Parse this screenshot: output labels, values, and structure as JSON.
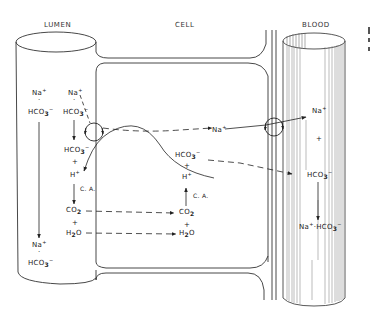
{
  "headers": {
    "lumen": "LUMEN",
    "cell": "CELL",
    "blood": "BLOOD"
  },
  "lumen_labels": {
    "left_na": {
      "base": "Na",
      "sup": "+"
    },
    "left_dot": "·",
    "left_hco3": {
      "base": "HCO",
      "sub": "3",
      "sup": "−"
    },
    "right_na": {
      "base": "Na",
      "sup": "+"
    },
    "right_dot": "·",
    "right_hco3": {
      "base": "HCO",
      "sub": "3",
      "sup": "−"
    },
    "bottom_na": {
      "base": "Na",
      "sup": "+"
    },
    "bottom_dot": "·",
    "bottom_hco3": {
      "base": "HCO",
      "sub": "3",
      "sup": "−"
    }
  },
  "luminal_side": {
    "hco3": {
      "base": "HCO",
      "sub": "3",
      "sup": "−"
    },
    "plus1": "+",
    "h": {
      "base": "H",
      "sup": "+"
    },
    "ca": "C. A.",
    "co2": {
      "base": "CO",
      "sub": "2"
    },
    "plus2": "+",
    "h2o": {
      "base": "H",
      "sub": "2",
      "tail": "O"
    }
  },
  "cell_side": {
    "hco3": {
      "base": "HCO",
      "sub": "3",
      "sup": "−"
    },
    "plus1": "+",
    "h": {
      "base": "H",
      "sup": "+"
    },
    "ca": "C. A.",
    "co2": {
      "base": "CO",
      "sub": "2"
    },
    "plus2": "+",
    "h2o": {
      "base": "H",
      "sub": "2",
      "tail": "O"
    },
    "na": {
      "base": "Na",
      "sup": "+"
    }
  },
  "blood_side": {
    "na": {
      "base": "Na",
      "sup": "+"
    },
    "plus": "+",
    "hco3": {
      "base": "HCO",
      "sub": "3",
      "sup": "−"
    },
    "product": {
      "na": "Na",
      "na_sup": "+",
      "dot": "·",
      "hco3": "HCO",
      "sub": "3",
      "sup": "−"
    }
  },
  "colors": {
    "ink": "#222222",
    "background": "#ffffff"
  }
}
